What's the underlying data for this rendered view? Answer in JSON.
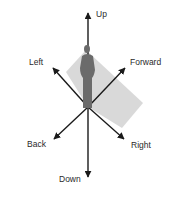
{
  "diagram": {
    "title": "",
    "labels": {
      "up": "Up",
      "down": "Down",
      "left": "Left",
      "right": "Right",
      "forward": "Forward",
      "back": "Back"
    },
    "colors": {
      "arrow": "#1a1a1a",
      "figure": "#6b6b6b",
      "plane": "#d9d9d9",
      "background": "#ffffff",
      "text": "#2a2a2a"
    }
  }
}
